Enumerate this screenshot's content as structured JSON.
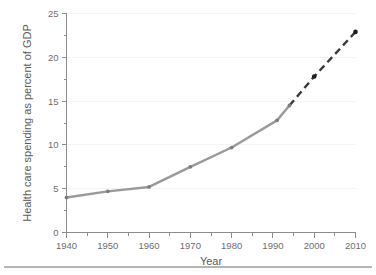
{
  "chart_data": {
    "type": "line",
    "title": "",
    "xlabel": "Year",
    "ylabel": "Health care spending as percent of GDP",
    "xlim": [
      1940,
      2010
    ],
    "ylim": [
      0,
      25
    ],
    "xticks": [
      1940,
      1950,
      1960,
      1970,
      1980,
      1990,
      2000,
      2010
    ],
    "xtick_labels": [
      "1940",
      "1950",
      "1960",
      "1970",
      "1980",
      "1990",
      "2000",
      "2010"
    ],
    "x_minor_ticks": [
      1945,
      1955,
      1965,
      1975,
      1985,
      1995,
      2005
    ],
    "yticks": [
      0,
      5,
      10,
      15,
      20,
      25
    ],
    "ytick_labels": [
      "0",
      "5",
      "10",
      "15",
      "20",
      "25"
    ],
    "y_minor_ticks": [
      2.5,
      7.5,
      12.5,
      17.5,
      22.5
    ],
    "grid": "horizontal-major-faint",
    "legend": "none",
    "series": [
      {
        "name": "Actual health care spending",
        "style": "solid",
        "color": "#9a9a9a",
        "marker_color": "#7d7d7d",
        "x": [
          1940,
          1950,
          1960,
          1970,
          1980,
          1991,
          1994
        ],
        "values": [
          4.0,
          4.7,
          5.2,
          7.5,
          9.7,
          12.8,
          14.5
        ]
      },
      {
        "name": "Projected health care spending",
        "style": "dashed",
        "color": "#3a3a3a",
        "marker_color": "#1c1c1c",
        "x": [
          1994,
          2000,
          2010
        ],
        "values": [
          14.5,
          17.8,
          22.9
        ]
      }
    ]
  }
}
